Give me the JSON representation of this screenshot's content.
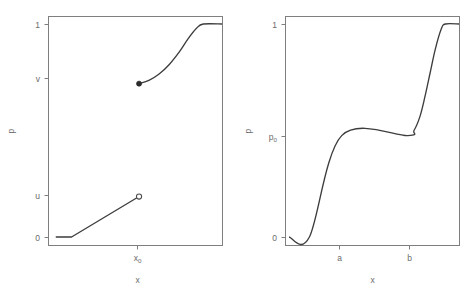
{
  "figure": {
    "background": "#ffffff",
    "curve_color": "#3d3d3d",
    "axis_color": "#7f7f7f",
    "label_color": "#6b6b6b",
    "width": 474,
    "height": 296
  },
  "chart_data": [
    {
      "type": "line",
      "panel": "left",
      "title": "",
      "xlabel": "x",
      "ylabel": "p",
      "xlim": [
        0,
        1
      ],
      "ylim": [
        0,
        1
      ],
      "grid": false,
      "legend": null,
      "xticks": [
        {
          "label": "x₀",
          "base": "x",
          "sub": "0",
          "value": 0.512
        }
      ],
      "yticks": [
        {
          "label": "0",
          "value": 0.0
        },
        {
          "label": "u",
          "value": 0.19
        },
        {
          "label": "1",
          "value": 1.0
        },
        {
          "label": "v",
          "value": 0.72
        }
      ],
      "ytick_order": [
        "0",
        "u",
        "v",
        "1"
      ],
      "description": "Discontinuous increasing curve: flat at 0, linear rise to open circle at (x0, u), jump up to solid dot at (x0, v), convex rise to 1, then flat at 1.",
      "series": [
        {
          "name": "lower-branch",
          "endpoint_marker": "open-circle",
          "x": [
            0.022,
            0.115,
            0.512
          ],
          "y": [
            0.0,
            0.0,
            0.19
          ]
        },
        {
          "name": "upper-branch",
          "endpoint_marker": "filled-dot",
          "x": [
            0.512,
            0.57,
            0.63,
            0.69,
            0.75,
            0.8,
            0.85,
            0.89,
            1.0
          ],
          "y": [
            0.72,
            0.735,
            0.765,
            0.81,
            0.87,
            0.93,
            0.98,
            1.0,
            1.0
          ]
        }
      ],
      "markers": [
        {
          "name": "open-circle",
          "x": 0.512,
          "y": 0.19,
          "style": "open"
        },
        {
          "name": "filled-dot",
          "x": 0.512,
          "y": 0.72,
          "style": "filled"
        }
      ]
    },
    {
      "type": "line",
      "panel": "right",
      "title": "",
      "xlabel": "x",
      "ylabel": "p",
      "xlim": [
        0,
        1
      ],
      "ylim": [
        0,
        1
      ],
      "grid": false,
      "legend": null,
      "xticks": [
        {
          "label": "a",
          "value": 0.31
        },
        {
          "label": "b",
          "value": 0.713
        }
      ],
      "yticks": [
        {
          "label": "0",
          "value": 0.0
        },
        {
          "label": "p₀",
          "base": "p",
          "sub": "0",
          "value": 0.476
        },
        {
          "label": "1",
          "value": 1.0
        }
      ],
      "ytick_order": [
        "0",
        "p₀",
        "1"
      ],
      "description": "Continuous increasing curve with a plateau: flat at 0, linear rise to p0 at x=a, flat plateau at p0 until x=b, steep rise to 1, then flat at 1.",
      "series": [
        {
          "name": "cdf",
          "x": [
            0.0,
            0.12,
            0.31,
            0.7,
            0.735,
            0.77,
            0.8,
            0.83,
            0.86,
            0.895,
            0.92,
            1.0
          ],
          "y": [
            0.0,
            0.0,
            0.476,
            0.476,
            0.5,
            0.565,
            0.66,
            0.77,
            0.88,
            0.975,
            1.0,
            1.0
          ]
        }
      ],
      "markers": []
    }
  ]
}
